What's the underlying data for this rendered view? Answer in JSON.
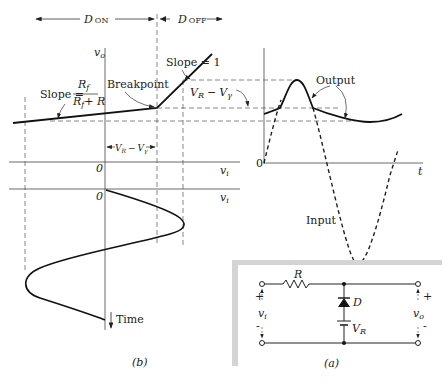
{
  "figure": {
    "transfer_characteristic": {
      "regions": {
        "d_on": {
          "label": "D",
          "sub": "ON"
        },
        "d_off": {
          "label": "D",
          "sub": "OFF"
        }
      },
      "y_axis_label": {
        "main": "v",
        "sub": "o"
      },
      "x_axis_label": {
        "main": "v",
        "sub": "i"
      },
      "origin_label": "0",
      "slope_on": {
        "prefix": "Slope =",
        "numerator": "R",
        "numerator_sub": "f",
        "denominator": "R",
        "denominator_sub": "f",
        "denominator_suffix": "+ R"
      },
      "slope_off": "Slope = 1",
      "breakpoint_label": "Breakpoint",
      "offset_label": {
        "a": "V",
        "a_sub": "R",
        "minus": "−",
        "b": "V",
        "b_sub": "γ"
      }
    },
    "input_vs_time": {
      "x_axis_label": {
        "main": "v",
        "sub": "i"
      },
      "origin_label": "0",
      "time_label": "Time"
    },
    "waveforms": {
      "output_label": "Output",
      "input_label": "Input",
      "t_axis_label": "t",
      "origin_label": "0",
      "offset_label": {
        "a": "V",
        "a_sub": "R",
        "minus": "−",
        "b": "V",
        "b_sub": "γ"
      }
    },
    "circuit": {
      "resistor_label": "R",
      "diode_label": "D",
      "source_label": {
        "main": "V",
        "sub": "R"
      },
      "input_label": {
        "main": "v",
        "sub": "i"
      },
      "output_label": {
        "main": "v",
        "sub": "o"
      },
      "plus": "+",
      "minus": "-"
    },
    "captions": {
      "b": "(b)",
      "a": "(a)"
    }
  }
}
